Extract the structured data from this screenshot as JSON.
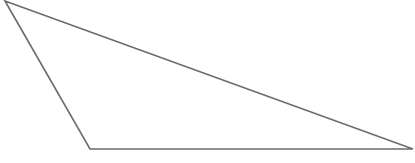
{
  "diagram": {
    "type": "triangle",
    "stroke_color": "#6b6b6b",
    "fill_color": "none",
    "stroke_width": 1.6,
    "vertices": [
      {
        "name": "top-left",
        "x": 5,
        "y": 1
      },
      {
        "name": "bottom-left",
        "x": 90,
        "y": 149
      },
      {
        "name": "right",
        "x": 413,
        "y": 149
      }
    ]
  }
}
